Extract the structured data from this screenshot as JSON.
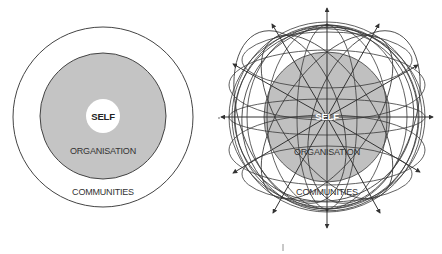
{
  "caption": {
    "text": "",
    "note": "partially cropped figure caption at top edge, illegible"
  },
  "left_diagram": {
    "title": "Concentric model",
    "center": [
      103,
      117
    ],
    "rings": [
      {
        "name": "communities",
        "label": "COMMUNITIES",
        "radius": 90,
        "fill": "#ffffff",
        "stroke": "#444444"
      },
      {
        "name": "organisation",
        "label": "ORGANISATION",
        "radius": 63,
        "fill": "#c4c4c4",
        "stroke": "#444444"
      },
      {
        "name": "self",
        "label": "SELF",
        "radius": 17,
        "fill": "#ffffff",
        "stroke": "none"
      }
    ]
  },
  "right_diagram": {
    "title": "Networked sphere model",
    "center": [
      327,
      117
    ],
    "labels": {
      "self": "SELF",
      "organisation": "ORGANISATION",
      "communities": "COMMUNITIES"
    },
    "organisation_fill": "#c0c0c0",
    "line_color": "#3a3a3a",
    "arrow_count": 12
  },
  "colors": {
    "background": "#ffffff",
    "grey_fill": "#c4c4c4",
    "stroke": "#444444"
  }
}
